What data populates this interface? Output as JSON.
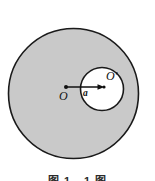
{
  "figure": {
    "type": "geometry-diagram",
    "background_color": "#ffffff",
    "outer_circle": {
      "name": "outer-circle",
      "center_label": "O",
      "fill_color": "#c9c9c9",
      "stroke_color": "#1a1a1a",
      "cx": 73.5,
      "cy": 93.5,
      "r": 65.5,
      "stroke_width": 1.6
    },
    "inner_circle": {
      "name": "inner-cavity-circle",
      "center_label": "O'",
      "fill_color": "#ffffff",
      "stroke_color": "#1a1a1a",
      "cx": 102,
      "cy": 89,
      "r": 21.5,
      "stroke_width": 1.6
    },
    "vector": {
      "name": "displacement-vector-a",
      "label": "a",
      "from_x": 66,
      "from_y": 87,
      "to_x": 104,
      "to_y": 87,
      "color": "#111111",
      "stroke_width": 1.4,
      "label_x": 86,
      "label_y": 96
    },
    "points": [
      {
        "label": "O",
        "x": 66,
        "y": 87,
        "label_x": 59,
        "label_y": 100
      },
      {
        "label": "O'",
        "x": 104,
        "y": 87,
        "label_x": 106,
        "label_y": 80
      }
    ]
  },
  "caption": {
    "text": "图 1 - 1 图"
  }
}
